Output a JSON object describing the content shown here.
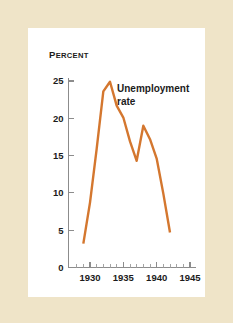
{
  "figure": {
    "frame_color": "#efe4c8",
    "panel_color": "#ffffff"
  },
  "chart_data": {
    "type": "line",
    "title": "",
    "xlabel": "",
    "ylabel": "Percent",
    "ylabel_first_letter": "P",
    "ylabel_rest": "ERCENT",
    "series": [
      {
        "name": "Unemployment rate",
        "color": "#d4772f",
        "x": [
          1929,
          1930,
          1931,
          1932,
          1933,
          1934,
          1935,
          1936,
          1937,
          1938,
          1939,
          1940,
          1941,
          1942
        ],
        "values": [
          3.2,
          8.7,
          15.9,
          23.6,
          24.9,
          21.7,
          20.1,
          16.9,
          14.3,
          19.0,
          17.2,
          14.6,
          9.9,
          4.7
        ]
      }
    ],
    "annotations": [
      {
        "name": "series-label",
        "line1": "Unemployment",
        "line2": "rate",
        "x": 1934.2,
        "y": 24.0
      }
    ],
    "xlim": [
      1927,
      1946
    ],
    "ylim": [
      0,
      26
    ],
    "xticks": [
      1930,
      1935,
      1940,
      1945
    ],
    "xtick_labels": [
      "1930",
      "1935",
      "1940",
      "1945"
    ],
    "xticks_minor_start": 1928,
    "xticks_minor_end": 1945,
    "yticks": [
      0,
      5,
      10,
      15,
      20,
      25
    ],
    "ytick_labels": [
      "0",
      "5",
      "10",
      "15",
      "20",
      "25"
    ],
    "grid": false,
    "legend": "none"
  }
}
